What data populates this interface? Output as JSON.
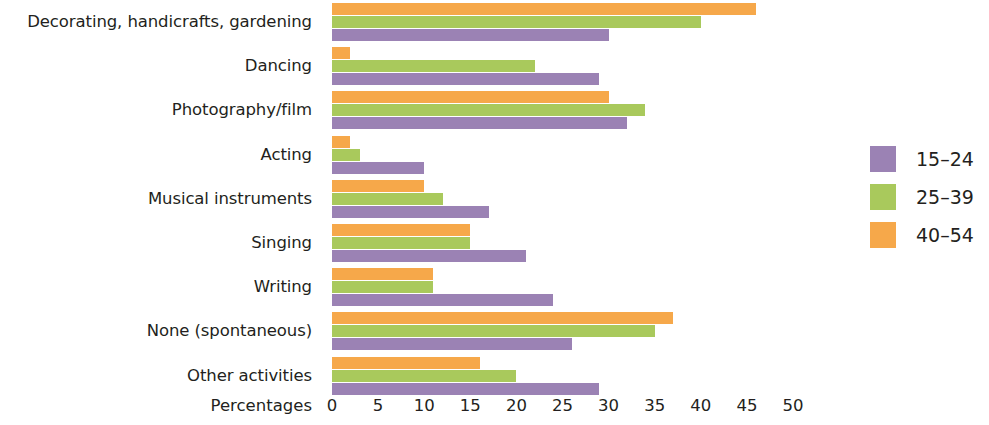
{
  "axis": {
    "title": "Percentages",
    "ticks": [
      0,
      5,
      10,
      15,
      20,
      25,
      30,
      35,
      40,
      45,
      50
    ]
  },
  "legend": {
    "items": [
      {
        "label": "15–24",
        "color": "#9b82b4"
      },
      {
        "label": "25–39",
        "color": "#a9c95c"
      },
      {
        "label": "40–54",
        "color": "#f6a84a"
      }
    ]
  },
  "chart_data": {
    "type": "bar",
    "orientation": "horizontal",
    "title": "",
    "subtitle": "",
    "xlabel": "Percentages",
    "ylabel": "",
    "xlim": [
      0,
      50
    ],
    "xticks": [
      0,
      5,
      10,
      15,
      20,
      25,
      30,
      35,
      40,
      45,
      50
    ],
    "grid": false,
    "legend_position": "right",
    "categories": [
      "Decorating, handicrafts, gardening",
      "Dancing",
      "Photography/film",
      "Acting",
      "Musical instruments",
      "Singing",
      "Writing",
      "None (spontaneous)",
      "Other activities"
    ],
    "series": [
      {
        "name": "15–24",
        "color": "#9b82b4",
        "values": [
          30,
          29,
          32,
          10,
          17,
          21,
          24,
          26,
          29
        ]
      },
      {
        "name": "25–39",
        "color": "#a9c95c",
        "values": [
          40,
          22,
          34,
          3,
          12,
          15,
          11,
          35,
          20
        ]
      },
      {
        "name": "40–54",
        "color": "#f6a84a",
        "values": [
          46,
          2,
          30,
          2,
          10,
          15,
          11,
          37,
          16
        ]
      }
    ]
  }
}
